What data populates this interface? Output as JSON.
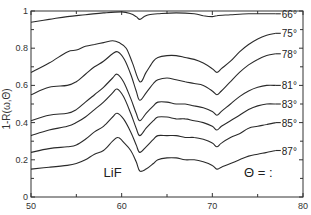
{
  "chart_data": {
    "type": "line",
    "title": "",
    "xlabel": "",
    "ylabel": "1-R(ω,Θ)",
    "xlim": [
      50,
      80
    ],
    "ylim": [
      0,
      1
    ],
    "xticks": [
      50,
      60,
      70,
      80
    ],
    "xminor": [
      55,
      65,
      75
    ],
    "yticks": [
      0,
      0.2,
      0.4,
      0.6,
      0.8,
      1
    ],
    "ytick_labels": [
      "0",
      "0.2",
      "0.4",
      "0.6",
      "0.8",
      "1"
    ],
    "grid": false,
    "annotations": [
      {
        "text": "LiF",
        "x": 58,
        "y": 0.11
      },
      {
        "text": "Θ = :",
        "x": 73.5,
        "y": 0.11
      }
    ],
    "legend_position": "right-inline",
    "series": [
      {
        "name": "66°",
        "x": [
          50,
          52,
          54,
          56,
          58,
          60,
          61,
          61.6,
          62,
          62.5,
          63,
          64,
          66,
          68,
          69,
          70,
          70.5,
          72,
          74,
          76,
          77
        ],
        "values": [
          0.94,
          0.955,
          0.97,
          0.98,
          0.99,
          0.995,
          0.985,
          0.97,
          0.955,
          0.97,
          0.98,
          0.985,
          0.99,
          0.985,
          0.975,
          0.97,
          0.975,
          0.98,
          0.985,
          0.985,
          0.985
        ]
      },
      {
        "name": "75°",
        "x": [
          50,
          52,
          54,
          55,
          56,
          57,
          58,
          59,
          59.7,
          60.5,
          61.2,
          62,
          62.7,
          63.5,
          64,
          65,
          66,
          67,
          68,
          69,
          70,
          70.5,
          71,
          72,
          73,
          74,
          75,
          76,
          77
        ],
        "values": [
          0.67,
          0.72,
          0.78,
          0.79,
          0.81,
          0.82,
          0.83,
          0.84,
          0.83,
          0.8,
          0.72,
          0.62,
          0.67,
          0.73,
          0.75,
          0.76,
          0.76,
          0.75,
          0.74,
          0.72,
          0.69,
          0.67,
          0.69,
          0.73,
          0.78,
          0.82,
          0.85,
          0.87,
          0.88
        ]
      },
      {
        "name": "78°",
        "x": [
          50,
          52,
          54,
          55,
          56,
          57,
          58,
          59,
          59.6,
          60.3,
          61,
          61.6,
          62,
          62.7,
          63.5,
          64,
          65,
          66,
          67,
          68,
          69,
          70,
          70.5,
          71,
          72,
          73,
          74,
          75,
          76,
          77
        ],
        "values": [
          0.55,
          0.59,
          0.6,
          0.62,
          0.66,
          0.7,
          0.73,
          0.77,
          0.78,
          0.74,
          0.66,
          0.57,
          0.52,
          0.56,
          0.61,
          0.63,
          0.64,
          0.63,
          0.62,
          0.61,
          0.6,
          0.57,
          0.55,
          0.57,
          0.62,
          0.67,
          0.71,
          0.74,
          0.76,
          0.77
        ]
      },
      {
        "name": "81°",
        "x": [
          50,
          52,
          54,
          55,
          56,
          57,
          58,
          59,
          59.5,
          60.2,
          61,
          61.6,
          62,
          62.7,
          63.5,
          64,
          65,
          66,
          67,
          68,
          69,
          70,
          70.5,
          71,
          72,
          73,
          74,
          75,
          76,
          77
        ],
        "values": [
          0.41,
          0.44,
          0.45,
          0.47,
          0.51,
          0.55,
          0.59,
          0.64,
          0.66,
          0.62,
          0.53,
          0.45,
          0.41,
          0.45,
          0.49,
          0.51,
          0.51,
          0.5,
          0.5,
          0.49,
          0.48,
          0.46,
          0.44,
          0.46,
          0.5,
          0.54,
          0.57,
          0.59,
          0.6,
          0.6
        ]
      },
      {
        "name": "83°",
        "x": [
          50,
          52,
          54,
          55,
          56,
          57,
          58,
          59,
          59.5,
          60.2,
          61,
          61.6,
          62,
          62.7,
          63.5,
          64,
          65,
          66,
          67,
          68,
          69,
          70,
          70.5,
          71,
          72,
          73,
          74,
          75,
          76,
          77
        ],
        "values": [
          0.33,
          0.36,
          0.38,
          0.4,
          0.43,
          0.47,
          0.51,
          0.56,
          0.58,
          0.54,
          0.45,
          0.37,
          0.33,
          0.37,
          0.41,
          0.43,
          0.43,
          0.42,
          0.42,
          0.41,
          0.4,
          0.38,
          0.36,
          0.38,
          0.41,
          0.44,
          0.47,
          0.49,
          0.5,
          0.5
        ]
      },
      {
        "name": "85°",
        "x": [
          50,
          52,
          54,
          55,
          56,
          57,
          58,
          59,
          59.5,
          60.2,
          61,
          61.6,
          62,
          62.7,
          63.5,
          64,
          65,
          66,
          67,
          68,
          69,
          70,
          70.5,
          71,
          72,
          73,
          74,
          75,
          76,
          77
        ],
        "values": [
          0.24,
          0.26,
          0.27,
          0.28,
          0.31,
          0.35,
          0.38,
          0.43,
          0.45,
          0.42,
          0.35,
          0.28,
          0.24,
          0.27,
          0.31,
          0.33,
          0.33,
          0.33,
          0.32,
          0.32,
          0.31,
          0.29,
          0.27,
          0.29,
          0.32,
          0.34,
          0.37,
          0.38,
          0.39,
          0.4
        ]
      },
      {
        "name": "87°",
        "x": [
          50,
          52,
          54,
          55,
          56,
          57,
          58,
          59,
          59.6,
          60.3,
          61,
          61.6,
          62,
          62.7,
          63.5,
          64,
          65,
          66,
          67,
          68,
          69,
          70,
          70.5,
          71,
          72,
          73,
          74,
          75,
          76,
          77
        ],
        "values": [
          0.15,
          0.16,
          0.17,
          0.18,
          0.2,
          0.23,
          0.25,
          0.3,
          0.32,
          0.29,
          0.25,
          0.19,
          0.14,
          0.15,
          0.18,
          0.2,
          0.21,
          0.21,
          0.2,
          0.2,
          0.19,
          0.17,
          0.15,
          0.16,
          0.18,
          0.2,
          0.22,
          0.23,
          0.24,
          0.25
        ]
      }
    ]
  }
}
